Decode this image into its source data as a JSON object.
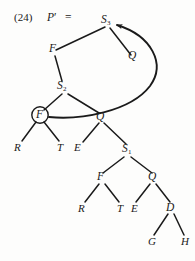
{
  "figure": {
    "equation_number": "(24)",
    "lhs": "P",
    "prime": "′",
    "operator": "=",
    "ink_color": "#1a1a1a",
    "background_color": "#fdfdfc"
  },
  "nodes": {
    "root": {
      "label": "S",
      "subscript": "3"
    },
    "f_upper": {
      "label": "F",
      "subscript": ""
    },
    "s2": {
      "label": "S",
      "subscript": "2"
    },
    "f_circled": {
      "label": "F",
      "subscript": ""
    },
    "q_upper": {
      "label": "Q",
      "subscript": ""
    },
    "leaf_r1": {
      "label": "R",
      "subscript": ""
    },
    "leaf_t1": {
      "label": "T",
      "subscript": ""
    },
    "leaf_e1": {
      "label": "E",
      "subscript": ""
    },
    "s1": {
      "label": "S",
      "subscript": "1"
    },
    "f_lower": {
      "label": "F",
      "subscript": ""
    },
    "q_lower": {
      "label": "Q",
      "subscript": ""
    },
    "leaf_r2": {
      "label": "R",
      "subscript": ""
    },
    "leaf_t2": {
      "label": "T",
      "subscript": ""
    },
    "leaf_e2": {
      "label": "E",
      "subscript": ""
    },
    "d": {
      "label": "D",
      "subscript": ""
    },
    "leaf_g": {
      "label": "G",
      "subscript": ""
    },
    "leaf_h": {
      "label": "H",
      "subscript": ""
    }
  },
  "annotations": {
    "movement_arrow": "curved arrow from circled F to S3"
  }
}
